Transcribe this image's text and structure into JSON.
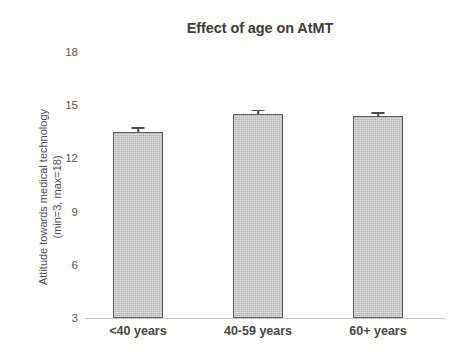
{
  "chart_data": {
    "type": "bar",
    "title": "Effect of age on AtMT",
    "xlabel": "",
    "ylabel": "Attitude towards medical technology (min=3, max=18)",
    "ylabel_lines": [
      "Attitude towards medical technology",
      "(min=3, max=18)"
    ],
    "categories": [
      "<40 years",
      "40-59 years",
      "60+ years"
    ],
    "values": [
      13.5,
      14.5,
      14.4
    ],
    "errors": [
      0.25,
      0.25,
      0.2
    ],
    "ylim": [
      3,
      18
    ],
    "yticks": [
      18,
      15,
      12,
      9,
      6,
      3
    ],
    "ytick_labels": [
      "18",
      "15",
      "12",
      "9",
      "6",
      "3"
    ],
    "grid": false,
    "legend": "none",
    "bar_fill_color": "#c2c2c2",
    "bar_border_color": "#5b5b5b",
    "error_bar_color": "#4d4d4d",
    "axis_color": "#c9c9c6",
    "background_color": "#fdfdfc",
    "text_color": "#4a4a4a"
  }
}
